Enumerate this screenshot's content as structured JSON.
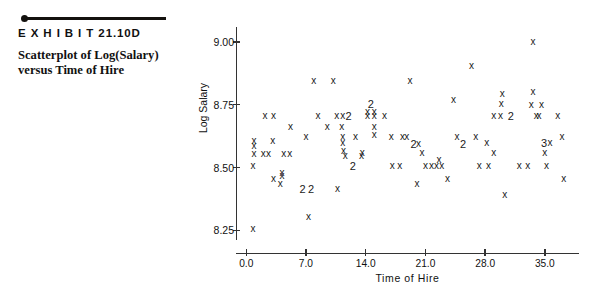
{
  "exhibit": {
    "label": "E X H I B I T   21.10D",
    "caption": "Scatterplot of Log(Salary) versus Time of Hire"
  },
  "chart_data": {
    "type": "scatter",
    "title": "Scatterplot of Log(Salary) versus Time of Hire",
    "xlabel": "Time of Hire",
    "ylabel": "Log Salary",
    "xlim": [
      -1.2,
      39.0
    ],
    "ylim": [
      8.16,
      9.06
    ],
    "grid": false,
    "legend": null,
    "marker": "x",
    "note": "Numerals ('2', '3') mark overplotted points: the digit is the count of coincident observations at that location.",
    "xticks": [
      0.0,
      7.0,
      14.0,
      21.0,
      28.0,
      35.0
    ],
    "xtick_labels": [
      "0.0",
      "7.0",
      "14.0",
      "21.0",
      "28.0",
      "35.0"
    ],
    "yticks": [
      8.25,
      8.5,
      8.75,
      9.0
    ],
    "ytick_labels": [
      "8.25",
      "8.50",
      "8.75",
      "9.00"
    ],
    "points": [
      {
        "x": 0.8,
        "y": 8.255,
        "n": 1,
        "m": "x"
      },
      {
        "x": 0.8,
        "y": 8.505,
        "n": 1,
        "m": "x"
      },
      {
        "x": 0.9,
        "y": 8.555,
        "n": 1,
        "m": "x"
      },
      {
        "x": 0.9,
        "y": 8.585,
        "n": 1,
        "m": "x"
      },
      {
        "x": 0.9,
        "y": 8.605,
        "n": 1,
        "m": "x"
      },
      {
        "x": 2.0,
        "y": 8.555,
        "n": 1,
        "m": "x"
      },
      {
        "x": 2.6,
        "y": 8.555,
        "n": 1,
        "m": "x"
      },
      {
        "x": 3.1,
        "y": 8.605,
        "n": 1,
        "m": "x"
      },
      {
        "x": 3.2,
        "y": 8.455,
        "n": 1,
        "m": "x"
      },
      {
        "x": 4.0,
        "y": 8.435,
        "n": 1,
        "m": "x"
      },
      {
        "x": 4.2,
        "y": 8.465,
        "n": 1,
        "m": "x"
      },
      {
        "x": 4.2,
        "y": 8.48,
        "n": 1,
        "m": "x"
      },
      {
        "x": 4.4,
        "y": 8.555,
        "n": 1,
        "m": "x"
      },
      {
        "x": 5.1,
        "y": 8.555,
        "n": 1,
        "m": "x"
      },
      {
        "x": 2.2,
        "y": 8.705,
        "n": 1,
        "m": "x"
      },
      {
        "x": 3.2,
        "y": 8.705,
        "n": 1,
        "m": "x"
      },
      {
        "x": 5.2,
        "y": 8.66,
        "n": 1,
        "m": "x"
      },
      {
        "x": 6.6,
        "y": 8.415,
        "n": 2,
        "m": "2"
      },
      {
        "x": 7.6,
        "y": 8.415,
        "n": 2,
        "m": "2"
      },
      {
        "x": 7.3,
        "y": 8.305,
        "n": 1,
        "m": "x"
      },
      {
        "x": 7.0,
        "y": 8.62,
        "n": 1,
        "m": "x"
      },
      {
        "x": 7.9,
        "y": 8.845,
        "n": 1,
        "m": "x"
      },
      {
        "x": 8.4,
        "y": 8.705,
        "n": 1,
        "m": "x"
      },
      {
        "x": 9.5,
        "y": 8.66,
        "n": 1,
        "m": "x"
      },
      {
        "x": 10.2,
        "y": 8.845,
        "n": 1,
        "m": "x"
      },
      {
        "x": 10.7,
        "y": 8.415,
        "n": 1,
        "m": "x"
      },
      {
        "x": 10.6,
        "y": 8.705,
        "n": 1,
        "m": "x"
      },
      {
        "x": 11.3,
        "y": 8.705,
        "n": 1,
        "m": "x"
      },
      {
        "x": 11.2,
        "y": 8.66,
        "n": 1,
        "m": "x"
      },
      {
        "x": 11.3,
        "y": 8.62,
        "n": 1,
        "m": "x"
      },
      {
        "x": 11.3,
        "y": 8.6,
        "n": 1,
        "m": "x"
      },
      {
        "x": 11.4,
        "y": 8.565,
        "n": 1,
        "m": "x"
      },
      {
        "x": 11.6,
        "y": 8.545,
        "n": 1,
        "m": "x"
      },
      {
        "x": 12.0,
        "y": 8.705,
        "n": 2,
        "m": "2"
      },
      {
        "x": 12.8,
        "y": 8.62,
        "n": 1,
        "m": "x"
      },
      {
        "x": 13.6,
        "y": 8.56,
        "n": 1,
        "m": "x"
      },
      {
        "x": 13.5,
        "y": 8.545,
        "n": 1,
        "m": "x"
      },
      {
        "x": 12.5,
        "y": 8.505,
        "n": 2,
        "m": "2"
      },
      {
        "x": 14.6,
        "y": 8.755,
        "n": 2,
        "m": "2"
      },
      {
        "x": 14.2,
        "y": 8.72,
        "n": 1,
        "m": "x"
      },
      {
        "x": 15.0,
        "y": 8.72,
        "n": 1,
        "m": "x"
      },
      {
        "x": 14.2,
        "y": 8.705,
        "n": 1,
        "m": "x"
      },
      {
        "x": 15.0,
        "y": 8.705,
        "n": 1,
        "m": "x"
      },
      {
        "x": 15.0,
        "y": 8.66,
        "n": 1,
        "m": "x"
      },
      {
        "x": 15.0,
        "y": 8.63,
        "n": 1,
        "m": "x"
      },
      {
        "x": 16.2,
        "y": 8.705,
        "n": 1,
        "m": "x"
      },
      {
        "x": 17.1,
        "y": 8.505,
        "n": 1,
        "m": "x"
      },
      {
        "x": 18.0,
        "y": 8.505,
        "n": 1,
        "m": "x"
      },
      {
        "x": 17.0,
        "y": 8.62,
        "n": 1,
        "m": "x"
      },
      {
        "x": 18.3,
        "y": 8.62,
        "n": 1,
        "m": "x"
      },
      {
        "x": 18.8,
        "y": 8.62,
        "n": 1,
        "m": "x"
      },
      {
        "x": 19.2,
        "y": 8.845,
        "n": 1,
        "m": "x"
      },
      {
        "x": 19.6,
        "y": 8.595,
        "n": 2,
        "m": "2"
      },
      {
        "x": 20.2,
        "y": 8.595,
        "n": 1,
        "m": "x"
      },
      {
        "x": 20.6,
        "y": 8.56,
        "n": 1,
        "m": "x"
      },
      {
        "x": 21.0,
        "y": 8.505,
        "n": 1,
        "m": "x"
      },
      {
        "x": 21.7,
        "y": 8.505,
        "n": 1,
        "m": "x"
      },
      {
        "x": 22.3,
        "y": 8.505,
        "n": 1,
        "m": "x"
      },
      {
        "x": 22.9,
        "y": 8.505,
        "n": 1,
        "m": "x"
      },
      {
        "x": 22.6,
        "y": 8.53,
        "n": 1,
        "m": "x"
      },
      {
        "x": 20.0,
        "y": 8.435,
        "n": 1,
        "m": "x"
      },
      {
        "x": 23.6,
        "y": 8.455,
        "n": 1,
        "m": "x"
      },
      {
        "x": 24.3,
        "y": 8.77,
        "n": 1,
        "m": "x"
      },
      {
        "x": 24.7,
        "y": 8.62,
        "n": 1,
        "m": "x"
      },
      {
        "x": 25.4,
        "y": 8.595,
        "n": 2,
        "m": "2"
      },
      {
        "x": 26.4,
        "y": 8.905,
        "n": 1,
        "m": "x"
      },
      {
        "x": 26.9,
        "y": 8.62,
        "n": 1,
        "m": "x"
      },
      {
        "x": 27.3,
        "y": 8.505,
        "n": 1,
        "m": "x"
      },
      {
        "x": 28.4,
        "y": 8.505,
        "n": 1,
        "m": "x"
      },
      {
        "x": 28.2,
        "y": 8.6,
        "n": 1,
        "m": "x"
      },
      {
        "x": 29.0,
        "y": 8.56,
        "n": 1,
        "m": "x"
      },
      {
        "x": 29.0,
        "y": 8.705,
        "n": 1,
        "m": "x"
      },
      {
        "x": 29.8,
        "y": 8.705,
        "n": 1,
        "m": "x"
      },
      {
        "x": 29.9,
        "y": 8.755,
        "n": 1,
        "m": "x"
      },
      {
        "x": 30.0,
        "y": 8.795,
        "n": 1,
        "m": "x"
      },
      {
        "x": 30.3,
        "y": 8.39,
        "n": 1,
        "m": "x"
      },
      {
        "x": 31.0,
        "y": 8.705,
        "n": 2,
        "m": "2"
      },
      {
        "x": 32.0,
        "y": 8.505,
        "n": 1,
        "m": "x"
      },
      {
        "x": 33.0,
        "y": 8.505,
        "n": 1,
        "m": "x"
      },
      {
        "x": 33.6,
        "y": 9.0,
        "n": 1,
        "m": "x"
      },
      {
        "x": 33.6,
        "y": 8.8,
        "n": 1,
        "m": "x"
      },
      {
        "x": 33.4,
        "y": 8.75,
        "n": 1,
        "m": "x"
      },
      {
        "x": 34.0,
        "y": 8.705,
        "n": 1,
        "m": "x"
      },
      {
        "x": 34.3,
        "y": 8.705,
        "n": 1,
        "m": "x"
      },
      {
        "x": 34.6,
        "y": 8.75,
        "n": 1,
        "m": "x"
      },
      {
        "x": 34.9,
        "y": 8.6,
        "n": 3,
        "m": "3"
      },
      {
        "x": 35.6,
        "y": 8.6,
        "n": 1,
        "m": "x"
      },
      {
        "x": 35.0,
        "y": 8.56,
        "n": 1,
        "m": "x"
      },
      {
        "x": 35.2,
        "y": 8.505,
        "n": 1,
        "m": "x"
      },
      {
        "x": 36.5,
        "y": 8.705,
        "n": 1,
        "m": "x"
      },
      {
        "x": 37.0,
        "y": 8.62,
        "n": 1,
        "m": "x"
      },
      {
        "x": 37.2,
        "y": 8.455,
        "n": 1,
        "m": "x"
      }
    ]
  }
}
